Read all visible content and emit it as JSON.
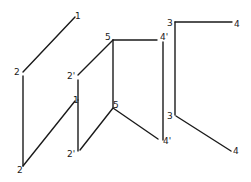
{
  "diagram": {
    "stroke_color": "#1a1a1a",
    "background": "#ffffff",
    "labels": [
      {
        "id": "top-1",
        "text": "1",
        "x": 75,
        "y": 19
      },
      {
        "id": "top-2",
        "text": "2",
        "x": 14,
        "y": 75
      },
      {
        "id": "top-2p",
        "text": "2'",
        "x": 67,
        "y": 79
      },
      {
        "id": "top-5",
        "text": "5",
        "x": 105,
        "y": 40
      },
      {
        "id": "top-4p",
        "text": "4'",
        "x": 160,
        "y": 40
      },
      {
        "id": "top-3",
        "text": "3",
        "x": 167,
        "y": 26
      },
      {
        "id": "top-4",
        "text": "4",
        "x": 234,
        "y": 27
      },
      {
        "id": "bot-1",
        "text": "1",
        "x": 73,
        "y": 103
      },
      {
        "id": "bot-2",
        "text": "2",
        "x": 17,
        "y": 173
      },
      {
        "id": "bot-2p",
        "text": "2'",
        "x": 67,
        "y": 157
      },
      {
        "id": "bot-5",
        "text": "5",
        "x": 113,
        "y": 108
      },
      {
        "id": "bot-3",
        "text": "3",
        "x": 167,
        "y": 119
      },
      {
        "id": "bot-4p",
        "text": "4'",
        "x": 163,
        "y": 144
      },
      {
        "id": "bot-4",
        "text": "4",
        "x": 233,
        "y": 154
      }
    ],
    "edges": [
      {
        "id": "top-1-2",
        "x1": 75,
        "y1": 17,
        "x2": 23,
        "y2": 72
      },
      {
        "id": "top-2p-5",
        "x1": 78,
        "y1": 75,
        "x2": 113,
        "y2": 40
      },
      {
        "id": "top-5-4p",
        "x1": 113,
        "y1": 40,
        "x2": 157,
        "y2": 40
      },
      {
        "id": "top-3-4",
        "x1": 175,
        "y1": 22,
        "x2": 232,
        "y2": 22
      },
      {
        "id": "proj-2",
        "x1": 23,
        "y1": 76,
        "x2": 23,
        "y2": 166
      },
      {
        "id": "proj-1",
        "x1": 78,
        "y1": 100,
        "x2": 78,
        "y2": 151
      },
      {
        "id": "proj-2p",
        "x1": 78,
        "y1": 80,
        "x2": 78,
        "y2": 100
      },
      {
        "id": "proj-5",
        "x1": 113,
        "y1": 40,
        "x2": 113,
        "y2": 107
      },
      {
        "id": "proj-4p",
        "x1": 163,
        "y1": 42,
        "x2": 163,
        "y2": 140
      },
      {
        "id": "proj-3",
        "x1": 175,
        "y1": 22,
        "x2": 175,
        "y2": 115
      },
      {
        "id": "bot-1-2",
        "x1": 75,
        "y1": 101,
        "x2": 23,
        "y2": 166
      },
      {
        "id": "bot-5-2p",
        "x1": 113,
        "y1": 108,
        "x2": 80,
        "y2": 150
      },
      {
        "id": "bot-5-4p",
        "x1": 113,
        "y1": 108,
        "x2": 158,
        "y2": 139
      },
      {
        "id": "bot-3-4",
        "x1": 176,
        "y1": 116,
        "x2": 231,
        "y2": 151
      }
    ]
  }
}
